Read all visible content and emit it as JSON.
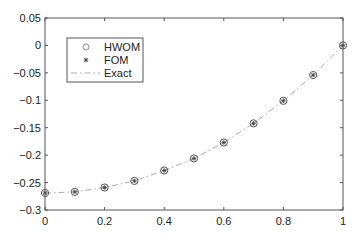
{
  "chart_data": {
    "type": "line",
    "title": "",
    "xlabel": "",
    "ylabel": "",
    "xlim": [
      0,
      1
    ],
    "ylim": [
      -0.3,
      0.05
    ],
    "grid": false,
    "legend_position": "upper-left",
    "x_ticks": [
      0,
      0.2,
      0.4,
      0.6,
      0.8,
      1
    ],
    "x_tick_labels": [
      "0",
      "0.2",
      "0.4",
      "0.6",
      "0.8",
      "1"
    ],
    "y_ticks": [
      0.05,
      0,
      -0.05,
      -0.1,
      -0.15,
      -0.2,
      -0.25,
      -0.3
    ],
    "y_tick_labels": [
      "0.05",
      "0",
      "−0.05",
      "−0.1",
      "−0.15",
      "−0.2",
      "−0.25",
      "−0.3"
    ],
    "x": [
      0,
      0.1,
      0.2,
      0.3,
      0.4,
      0.5,
      0.6,
      0.7,
      0.8,
      0.9,
      1.0
    ],
    "series": [
      {
        "name": "HWOM",
        "marker": "circle",
        "line": "none",
        "values": [
          -0.269,
          -0.267,
          -0.259,
          -0.247,
          -0.228,
          -0.206,
          -0.177,
          -0.142,
          -0.101,
          -0.054,
          0.0
        ]
      },
      {
        "name": "FOM",
        "marker": "asterisk",
        "line": "none",
        "values": [
          -0.269,
          -0.267,
          -0.259,
          -0.247,
          -0.228,
          -0.206,
          -0.177,
          -0.142,
          -0.101,
          -0.054,
          0.0
        ]
      },
      {
        "name": "Exact",
        "marker": "none",
        "line": "dash-dot",
        "values": [
          -0.269,
          -0.267,
          -0.259,
          -0.247,
          -0.228,
          -0.206,
          -0.177,
          -0.142,
          -0.101,
          -0.054,
          0.0
        ]
      }
    ],
    "legend": [
      "HWOM",
      "FOM",
      "Exact"
    ],
    "colors": {
      "axes": "#555555",
      "markers": "#444444",
      "exact_line": "#aaaaaa",
      "text": "#222222"
    }
  }
}
